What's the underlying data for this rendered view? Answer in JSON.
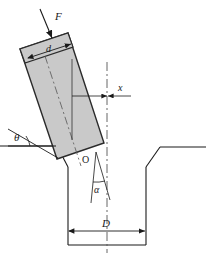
{
  "figure": {
    "kind": "engineering-cross-section-diagram",
    "background_color": "#ffffff",
    "line_color": "#1a1a1a",
    "block_fill_color": "#c9c9c9",
    "block_edge_color": "#2b2b2b",
    "labels": {
      "force": "F",
      "block_width": "d",
      "offset": "x",
      "incline_angle": "θ",
      "pivot_point": "O",
      "groove_half_angle": "α",
      "groove_width": "D"
    },
    "geometry": {
      "block": {
        "rotation_deg": 17,
        "corners": [
          [
            20,
            49
          ],
          [
            68,
            33
          ],
          [
            104,
            143
          ],
          [
            57,
            159
          ]
        ],
        "top_band_corners": [
          [
            20,
            49
          ],
          [
            68,
            33
          ],
          [
            73,
            47
          ],
          [
            25,
            63
          ]
        ]
      },
      "force_arrow": {
        "from": [
          41,
          10
        ],
        "to": [
          52,
          37
        ]
      },
      "d_dimension": {
        "from": [
          29,
          57
        ],
        "to": [
          70,
          44
        ]
      },
      "x_dimension": {
        "from": [
          72,
          96
        ],
        "to": [
          106,
          96
        ]
      },
      "theta_baseline": {
        "from": [
          8,
          146
        ],
        "to": [
          55,
          146
        ]
      },
      "theta_ray": {
        "from": [
          8,
          130
        ],
        "to": [
          57,
          157
        ]
      },
      "pivot": [
        95,
        151
      ],
      "groove_centerline_x": 107,
      "D_dimension": {
        "from": [
          68,
          231
        ],
        "to": [
          146,
          231
        ]
      },
      "groove_outline": [
        [
          0,
          146
        ],
        [
          57,
          146
        ],
        [
          68,
          166
        ],
        [
          68,
          245
        ],
        [
          146,
          245
        ],
        [
          146,
          166
        ],
        [
          160,
          147
        ],
        [
          211,
          147
        ]
      ]
    }
  }
}
